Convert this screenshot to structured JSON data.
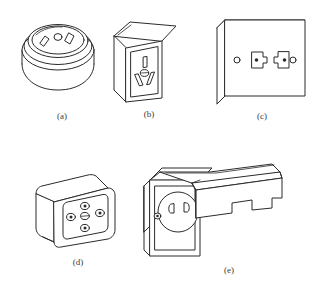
{
  "sheet": {
    "title": "Electrical socket and outlet pictorial views",
    "background_color": "#ffffff",
    "line_color": "#2b2b2b",
    "caption_color": "#3a3a3a",
    "width": 325,
    "height": 299,
    "projection": "isometric line drawing",
    "figure_count": 5
  },
  "figures": [
    {
      "id": "a",
      "caption": "(a)",
      "name": "round-surface-mounted-socket",
      "description": "Cylindrical round surface-mounted socket with angled flat pin slots and a small round hole on the top face",
      "row": 1,
      "column": 1,
      "features": [
        "round body",
        "two angled slots",
        "one small circular hole"
      ]
    },
    {
      "id": "b",
      "caption": "(b)",
      "name": "rectangular-box-socket",
      "description": "Rectangular surface-mounted socket box with a vertical slot above and two angled slots flanking a small circle",
      "row": 1,
      "column": 2,
      "features": [
        "rectangular body",
        "vertical slot",
        "two angled slots",
        "center circle"
      ]
    },
    {
      "id": "c",
      "caption": "(c)",
      "name": "flat-wall-plate-two-gang",
      "description": "Flat square wall plate with two mirrored keyhole outlet openings and two screw holes",
      "row": 1,
      "column": 3,
      "features": [
        "flat plate",
        "two keyhole openings",
        "two screw holes"
      ]
    },
    {
      "id": "d",
      "caption": "(d)",
      "name": "rounded-square-five-hole-socket",
      "description": "Rounded square surface box with five round openings arranged in a cross pattern",
      "row": 2,
      "column": 1,
      "features": [
        "rounded square body",
        "five round holes",
        "cross arrangement"
      ]
    },
    {
      "id": "e",
      "caption": "(e)",
      "name": "socket-with-hinged-cover",
      "description": "Wall plate with circular recessed socket having two D-shaped slots, a screw, and a protruding hinged cover hood",
      "row": 2,
      "column": 2,
      "features": [
        "wall plate",
        "circular recess",
        "two D slots",
        "screw",
        "hinged cover"
      ]
    }
  ]
}
